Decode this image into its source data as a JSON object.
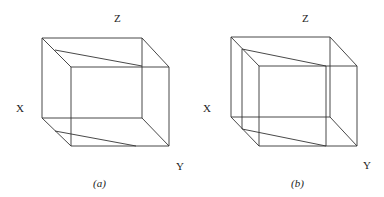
{
  "figure": {
    "panels": [
      {
        "id": "a",
        "caption": "(a)",
        "axis_labels": {
          "x": "X",
          "y": "Y",
          "z": "Z"
        },
        "description": "Wireframe cube with one slanted cutting plane"
      },
      {
        "id": "b",
        "caption": "(b)",
        "axis_labels": {
          "x": "X",
          "y": "Y",
          "z": "Z"
        },
        "description": "Wireframe cube with slanted cutting plane and additional inner vertical plane"
      }
    ]
  }
}
